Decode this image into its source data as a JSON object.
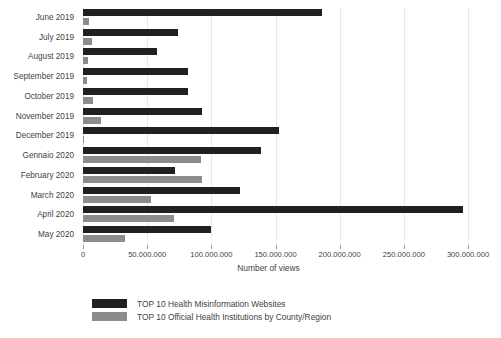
{
  "chart_data": {
    "type": "bar",
    "orientation": "horizontal",
    "title": "",
    "xlabel": "Number of views",
    "ylabel": "",
    "xlim": [
      0,
      300000000
    ],
    "xticks": [
      0,
      50000000,
      100000000,
      150000000,
      200000000,
      250000000,
      300000000
    ],
    "xticklabels": [
      "0",
      "50.000.000",
      "100.000.000",
      "150.000.000",
      "200.000.000",
      "250.000.000",
      "300.000.000"
    ],
    "grid": "vertical",
    "legend_position": "bottom",
    "categories": [
      "June 2019",
      "July 2019",
      "August 2019",
      "September 2019",
      "October 2019",
      "November 2019",
      "December 2019",
      "Gennaio 2020",
      "February 2020",
      "March 2020",
      "April 2020",
      "May 2020"
    ],
    "series": [
      {
        "name": "TOP 10 Health Misinformation Websites",
        "color": "#231f20",
        "values": [
          186000000,
          74000000,
          58000000,
          82000000,
          82000000,
          93000000,
          153000000,
          139000000,
          72000000,
          122000000,
          296000000,
          100000000
        ]
      },
      {
        "name": "TOP 10 Official Health Institutions by County/Region",
        "color": "#8c8c8c",
        "values": [
          5000000,
          7000000,
          4000000,
          3500000,
          8000000,
          14000000,
          1000000,
          92000000,
          93000000,
          53000000,
          71000000,
          33000000
        ]
      }
    ]
  }
}
